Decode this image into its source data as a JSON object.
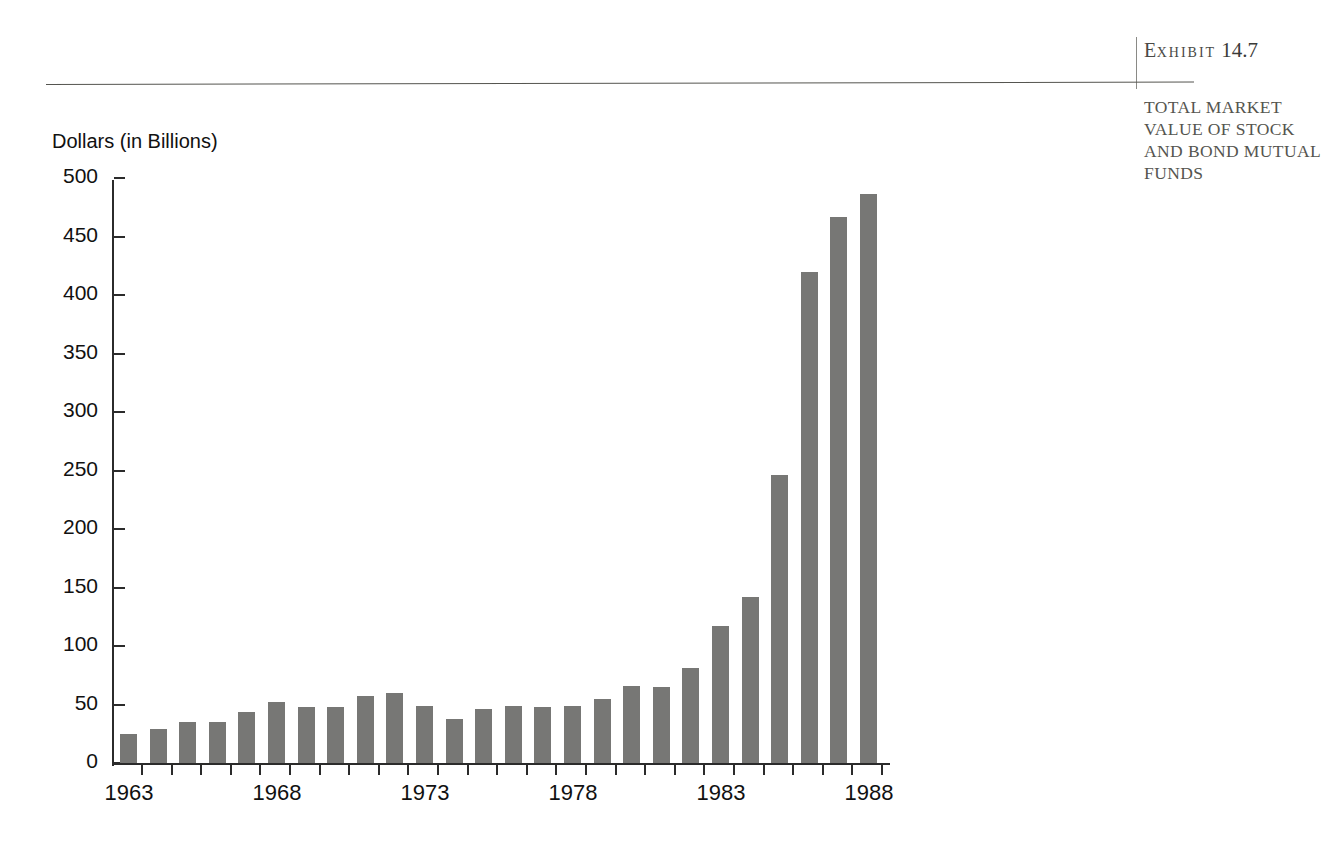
{
  "exhibit": {
    "label_prefix": "E",
    "label_rest": "XHIBIT",
    "number": "14.7",
    "caption": "TOTAL MARKET VALUE OF STOCK AND BOND MUTUAL FUNDS"
  },
  "chart_data": {
    "type": "bar",
    "title": "",
    "subtitle": "",
    "xlabel": "",
    "ylabel": "Dollars (in Billions)",
    "ylim": [
      0,
      500
    ],
    "y_ticks": [
      0,
      50,
      100,
      150,
      200,
      250,
      300,
      350,
      400,
      450,
      500
    ],
    "y_tick_labels": [
      "0",
      "50",
      "100",
      "150",
      "200",
      "250",
      "300",
      "350",
      "400",
      "450",
      "500"
    ],
    "grid": false,
    "legend": null,
    "bar_color": "#777775",
    "axis_color": "#2b2b2b",
    "x_tick_labels_shown": [
      "1963",
      "1968",
      "1973",
      "1978",
      "1983",
      "1988"
    ],
    "categories": [
      "1963",
      "1964",
      "1965",
      "1966",
      "1967",
      "1968",
      "1969",
      "1970",
      "1971",
      "1972",
      "1973",
      "1974",
      "1975",
      "1976",
      "1977",
      "1978",
      "1979",
      "1980",
      "1981",
      "1982",
      "1983",
      "1984",
      "1985",
      "1986",
      "1987",
      "1988"
    ],
    "values": [
      25,
      29,
      35,
      35,
      44,
      52,
      48,
      48,
      57,
      60,
      49,
      38,
      46,
      49,
      48,
      49,
      55,
      66,
      65,
      81,
      117,
      142,
      246,
      420,
      467,
      486
    ],
    "series": [
      {
        "name": "Total market value of stock and bond mutual funds",
        "values": [
          25,
          29,
          35,
          35,
          44,
          52,
          48,
          48,
          57,
          60,
          49,
          38,
          46,
          49,
          48,
          49,
          55,
          66,
          65,
          81,
          117,
          142,
          246,
          420,
          467,
          486
        ]
      }
    ]
  }
}
